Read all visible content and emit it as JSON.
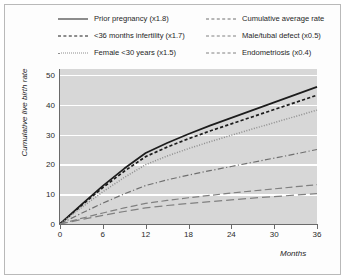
{
  "chart_data": {
    "type": "line",
    "title": "",
    "xlabel": "Months",
    "ylabel": "Cumulative live birth rate",
    "xlim": [
      0,
      36
    ],
    "ylim": [
      0,
      52
    ],
    "xticks": [
      0,
      6,
      12,
      18,
      24,
      30,
      36
    ],
    "yticks": [
      0,
      10,
      20,
      30,
      40,
      50
    ],
    "grid": "horizontal",
    "legend_position": "top",
    "x": [
      0,
      3,
      6,
      9,
      12,
      15,
      18,
      21,
      24,
      27,
      30,
      33,
      36
    ],
    "series": [
      {
        "name": "Prior pregnancy (x1.8)",
        "style": "solid",
        "color": "#1c1c1c",
        "values": [
          0,
          6.5,
          12.8,
          18.6,
          23.8,
          27.2,
          30.2,
          33.0,
          35.6,
          38.2,
          40.8,
          43.4,
          46.0
        ]
      },
      {
        "name": "<36 months infertility (x1.7)",
        "style": "dashed",
        "color": "#1c1c1c",
        "values": [
          0,
          6.2,
          12.2,
          17.7,
          22.6,
          25.8,
          28.6,
          31.2,
          33.6,
          36.0,
          38.4,
          40.8,
          43.2
        ]
      },
      {
        "name": "Female <30 years (x1.5)",
        "style": "dotted",
        "color": "#8e8e8e",
        "values": [
          0,
          5.5,
          10.8,
          15.6,
          19.9,
          22.8,
          25.3,
          27.6,
          29.8,
          31.9,
          34.0,
          36.1,
          38.2
        ]
      },
      {
        "name": "Cumulative average rate",
        "style": "dashdot",
        "color": "#6f6f6f",
        "values": [
          0,
          3.6,
          7.0,
          10.1,
          12.9,
          14.8,
          16.4,
          17.9,
          19.3,
          20.7,
          22.1,
          23.5,
          25.0
        ]
      },
      {
        "name": "Male/tubal defect (x0.5)",
        "style": "longdash",
        "color": "#808080",
        "values": [
          0,
          1.9,
          3.7,
          5.4,
          6.9,
          7.9,
          8.8,
          9.6,
          10.4,
          11.1,
          11.8,
          12.5,
          13.2
        ]
      },
      {
        "name": "Endometriosis (x0.4)",
        "style": "longdash2",
        "color": "#808080",
        "values": [
          0,
          1.5,
          2.9,
          4.2,
          5.4,
          6.2,
          6.9,
          7.5,
          8.1,
          8.7,
          9.2,
          9.7,
          10.2
        ]
      }
    ]
  },
  "legend": {
    "left_entries": [
      {
        "label": "Prior pregnancy (x1.8)",
        "style": "solid"
      },
      {
        "label": "<36 months infertility (x1.7)",
        "style": "dashed"
      },
      {
        "label": "Female <30 years (x1.5)",
        "style": "dotted"
      }
    ],
    "right_entries": [
      {
        "label": "Cumulative average rate",
        "style": "dashdot"
      },
      {
        "label": "Male/tubal defect (x0.5)",
        "style": "longdash"
      },
      {
        "label": "Endometriosis (x0.4)",
        "style": "longdash2"
      }
    ]
  }
}
